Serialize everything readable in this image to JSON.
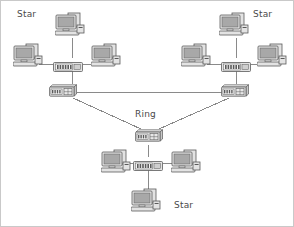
{
  "diagram": {
    "width": 294,
    "height": 227,
    "background_color": "#ffffff",
    "border_color": "#c9c9c9",
    "line_color": "#8a8a8a",
    "device_fill": "#e3e3e3",
    "device_stroke": "#5a5a5a",
    "screen_fill": "#a8a8a8",
    "label_color": "#4a4a4a"
  },
  "labels": [
    {
      "id": "star-top-left",
      "text": "Star",
      "x": 16,
      "y": 8
    },
    {
      "id": "star-top-right",
      "text": "Star",
      "x": 252,
      "y": 8
    },
    {
      "id": "ring-center",
      "text": "Ring",
      "x": 134,
      "y": 108
    },
    {
      "id": "star-bottom",
      "text": "Star",
      "x": 173,
      "y": 199
    }
  ],
  "clusters": [
    {
      "id": "star-cluster-top-left",
      "label": "Star",
      "hub": {
        "id": "hub-top-left",
        "type": "hub",
        "x": 52,
        "y": 57
      },
      "switch": {
        "id": "switch-top-left",
        "type": "switch",
        "x": 46,
        "y": 83
      },
      "computers": [
        {
          "id": "pc-top-left-north",
          "x": 54,
          "y": 10
        },
        {
          "id": "pc-top-left-west",
          "x": 12,
          "y": 41
        },
        {
          "id": "pc-top-left-east",
          "x": 90,
          "y": 41
        }
      ]
    },
    {
      "id": "star-cluster-top-right",
      "label": "Star",
      "hub": {
        "id": "hub-top-right",
        "type": "hub",
        "x": 220,
        "y": 57
      },
      "switch": {
        "id": "switch-top-right",
        "type": "switch",
        "x": 218,
        "y": 83
      },
      "computers": [
        {
          "id": "pc-top-right-north",
          "x": 218,
          "y": 10
        },
        {
          "id": "pc-top-right-west",
          "x": 180,
          "y": 41
        },
        {
          "id": "pc-top-right-east",
          "x": 256,
          "y": 41
        }
      ]
    },
    {
      "id": "star-cluster-bottom",
      "label": "Star",
      "hub": {
        "id": "hub-bottom",
        "type": "hub",
        "x": 132,
        "y": 156
      },
      "switch": {
        "id": "switch-bottom",
        "type": "switch",
        "x": 132,
        "y": 128
      },
      "computers": [
        {
          "id": "pc-bottom-west",
          "x": 100,
          "y": 147
        },
        {
          "id": "pc-bottom-east",
          "x": 170,
          "y": 147
        },
        {
          "id": "pc-bottom-south",
          "x": 130,
          "y": 186
        }
      ]
    }
  ],
  "links": [
    {
      "id": "link-tl-hub-to-north-pc",
      "kind": "star",
      "x1": 71,
      "y1": 37,
      "x2": 71,
      "y2": 57
    },
    {
      "id": "link-tl-hub-to-west-pc",
      "kind": "star",
      "x1": 38,
      "y1": 63,
      "x2": 52,
      "y2": 63
    },
    {
      "id": "link-tl-hub-to-east-pc",
      "kind": "star",
      "x1": 82,
      "y1": 63,
      "x2": 96,
      "y2": 63
    },
    {
      "id": "link-tl-hub-to-switch",
      "kind": "uplink",
      "x1": 71,
      "y1": 69,
      "x2": 71,
      "y2": 83
    },
    {
      "id": "link-tr-hub-to-north-pc",
      "kind": "star",
      "x1": 235,
      "y1": 37,
      "x2": 235,
      "y2": 57
    },
    {
      "id": "link-tr-hub-to-west-pc",
      "kind": "star",
      "x1": 206,
      "y1": 63,
      "x2": 220,
      "y2": 63
    },
    {
      "id": "link-tr-hub-to-east-pc",
      "kind": "star",
      "x1": 250,
      "y1": 63,
      "x2": 262,
      "y2": 63
    },
    {
      "id": "link-tr-hub-to-switch",
      "kind": "uplink",
      "x1": 235,
      "y1": 69,
      "x2": 235,
      "y2": 83
    },
    {
      "id": "link-bottom-hub-to-west-pc",
      "kind": "star",
      "x1": 124,
      "y1": 162,
      "x2": 132,
      "y2": 162
    },
    {
      "id": "link-bottom-hub-to-east-pc",
      "kind": "star",
      "x1": 162,
      "y1": 162,
      "x2": 176,
      "y2": 162
    },
    {
      "id": "link-bottom-hub-to-south-pc",
      "kind": "star",
      "x1": 147,
      "y1": 168,
      "x2": 147,
      "y2": 188
    },
    {
      "id": "link-bottom-hub-to-switch",
      "kind": "uplink",
      "x1": 147,
      "y1": 144,
      "x2": 147,
      "y2": 156
    },
    {
      "id": "ring-link-top",
      "kind": "ring",
      "x1": 76,
      "y1": 91,
      "x2": 228,
      "y2": 91
    },
    {
      "id": "ring-link-left",
      "kind": "ring",
      "x1": 72,
      "y1": 97,
      "x2": 140,
      "y2": 128
    },
    {
      "id": "ring-link-right",
      "kind": "ring",
      "x1": 228,
      "y1": 97,
      "x2": 158,
      "y2": 128
    }
  ],
  "topology_summary": {
    "star_clusters": 3,
    "ring_nodes": 3,
    "computers_total": 9,
    "hubs_total": 3,
    "switches_total": 3
  }
}
